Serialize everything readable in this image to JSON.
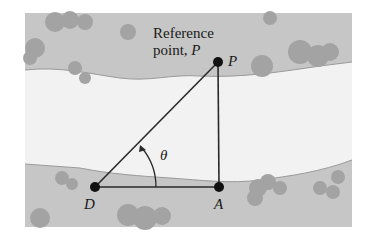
{
  "diagram": {
    "title_label_line1": "Reference",
    "title_label_line2_prefix": "point, ",
    "title_label_line2_var": "P",
    "points": [
      {
        "id": "P",
        "label": "P",
        "x": 218,
        "y": 62
      },
      {
        "id": "A",
        "label": "A",
        "x": 219,
        "y": 187
      },
      {
        "id": "D",
        "label": "D",
        "x": 95,
        "y": 187
      }
    ],
    "angle_label": "θ",
    "edges": [
      [
        "D",
        "P"
      ],
      [
        "P",
        "A"
      ],
      [
        "D",
        "A"
      ]
    ],
    "colors": {
      "land": "#c4c4c4",
      "river": "#f3f3f3",
      "trees": "#a5a5a5",
      "line": "#2a2a2a",
      "point": "#111111"
    }
  }
}
